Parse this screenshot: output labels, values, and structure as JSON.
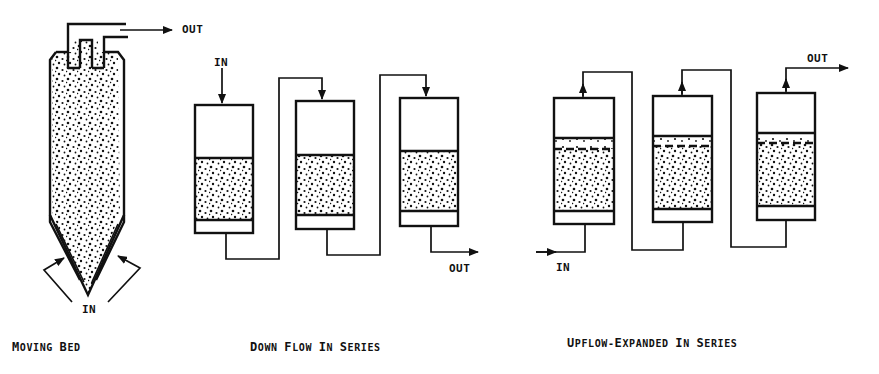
{
  "colors": {
    "ink": "#111111",
    "background": "#ffffff"
  },
  "moving_bed": {
    "caption": "Moving Bed",
    "caption_parts": [
      "M",
      "OVING ",
      "B",
      "ED"
    ],
    "out_label": "OUT",
    "in_label": "IN"
  },
  "down_flow": {
    "caption": "Down Flow In Series",
    "caption_parts": [
      "D",
      "OWN ",
      "F",
      "LOW ",
      "I",
      "N ",
      "S",
      "ERIES"
    ],
    "in_label": "IN",
    "out_label": "OUT",
    "columns": [
      {
        "x": 195,
        "top": 105,
        "media_top": 158,
        "media_bottom": 220,
        "bottom": 233,
        "width": 58
      },
      {
        "x": 296,
        "top": 101,
        "media_top": 155,
        "media_bottom": 215,
        "bottom": 229,
        "width": 58
      },
      {
        "x": 400,
        "top": 98,
        "media_top": 151,
        "media_bottom": 211,
        "bottom": 226,
        "width": 58
      }
    ]
  },
  "upflow_expanded": {
    "caption": "Upflow-Expanded In Series",
    "caption_parts": [
      "U",
      "PFLOW-",
      "E",
      "XPANDED ",
      "I",
      "N ",
      "S",
      "ERIES"
    ],
    "in_label": "IN",
    "out_label": "OUT",
    "columns": [
      {
        "x": 554,
        "top": 98,
        "media_top": 138,
        "dash": 149,
        "media_bottom": 211,
        "bottom": 224,
        "width": 60
      },
      {
        "x": 653,
        "top": 96,
        "media_top": 136,
        "dash": 146,
        "media_bottom": 209,
        "bottom": 222,
        "width": 59
      },
      {
        "x": 757,
        "top": 93,
        "media_top": 133,
        "dash": 143,
        "media_bottom": 206,
        "bottom": 220,
        "width": 58
      }
    ]
  }
}
